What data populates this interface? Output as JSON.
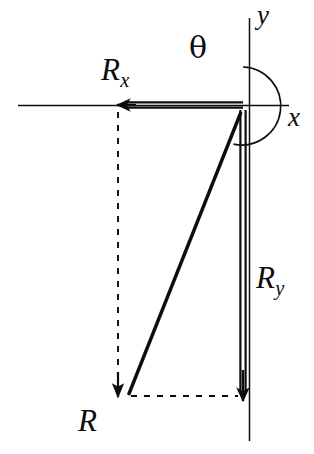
{
  "figure": {
    "background_color": "#ffffff",
    "ink_color": "#0d0d0d",
    "width": 314,
    "height": 454
  },
  "axes": {
    "x_axis": {
      "label": "x",
      "line": {
        "x1": 18,
        "y1": 105,
        "x2": 288,
        "y2": 105
      },
      "label_pos": {
        "x": 288,
        "y": 104
      }
    },
    "y_axis": {
      "label": "y",
      "line": {
        "x1": 249,
        "y1": 18,
        "x2": 249,
        "y2": 441
      },
      "label_pos": {
        "x": 257,
        "y": 2
      }
    },
    "origin": {
      "x": 243,
      "y": 106
    }
  },
  "angle": {
    "symbol": "θ",
    "label": "θ",
    "description": "angle measured from positive y-axis counterclockwise around to the resultant R",
    "arc_center": {
      "x": 243,
      "y": 106
    },
    "arc_radius": 39,
    "start_deg_from_x": 90,
    "sweep_deg": 248,
    "label_pos": {
      "x": 189,
      "y": 33
    }
  },
  "vectors": [
    {
      "name": "R",
      "label": "R",
      "subscript": "",
      "style": "solid-thick",
      "arrowhead": "small",
      "from": {
        "x": 241,
        "y": 112
      },
      "to": {
        "x": 128,
        "y": 396
      },
      "label_pos": {
        "x": 78,
        "y": 405
      }
    },
    {
      "name": "Rx",
      "label": "R",
      "subscript": "x",
      "style": "double-line",
      "arrowhead": "large",
      "from": {
        "x": 243,
        "y": 105
      },
      "to": {
        "x": 116,
        "y": 105
      },
      "label_pos": {
        "x": 101,
        "y": 54
      }
    },
    {
      "name": "Ry",
      "label": "R",
      "subscript": "y",
      "style": "double-line",
      "arrowhead": "large",
      "from": {
        "x": 243,
        "y": 110
      },
      "to": {
        "x": 243,
        "y": 401
      },
      "label_pos": {
        "x": 256,
        "y": 262
      }
    }
  ],
  "construction_lines": [
    {
      "name": "projection-vertical-dashed",
      "style": "dashed",
      "arrowhead": "small",
      "from": {
        "x": 118,
        "y": 112
      },
      "to": {
        "x": 118,
        "y": 396
      }
    },
    {
      "name": "projection-horizontal-dashed",
      "style": "dashed",
      "arrowhead": "none",
      "from": {
        "x": 131,
        "y": 396
      },
      "to": {
        "x": 238,
        "y": 396
      }
    }
  ]
}
